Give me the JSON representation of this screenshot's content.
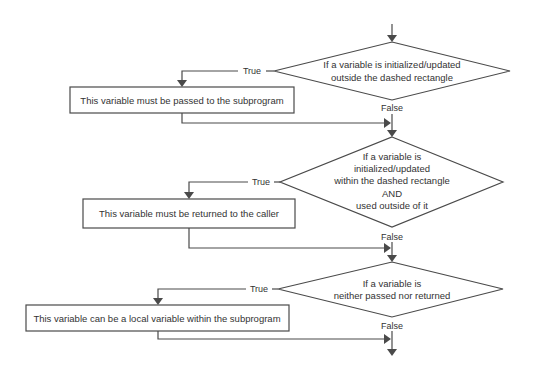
{
  "colors": {
    "stroke": "#4a4a4a",
    "text": "#333333",
    "background": "#ffffff"
  },
  "flowchart": {
    "decisions": [
      {
        "lines": [
          "If a variable is initialized/updated",
          "outside the dashed rectangle"
        ],
        "true_label": "True",
        "false_label": "False"
      },
      {
        "lines": [
          "If a variable is",
          "initialized/updated",
          "within the dashed rectangle",
          "AND",
          "used outside of it"
        ],
        "true_label": "True",
        "false_label": "False"
      },
      {
        "lines": [
          "If a variable is",
          "neither passed nor returned"
        ],
        "true_label": "True",
        "false_label": "False"
      }
    ],
    "actions": [
      {
        "label": "This variable must be passed to the subprogram"
      },
      {
        "label": "This variable must be returned to the caller"
      },
      {
        "label": "This variable can be a local variable within the subprogram"
      }
    ]
  }
}
